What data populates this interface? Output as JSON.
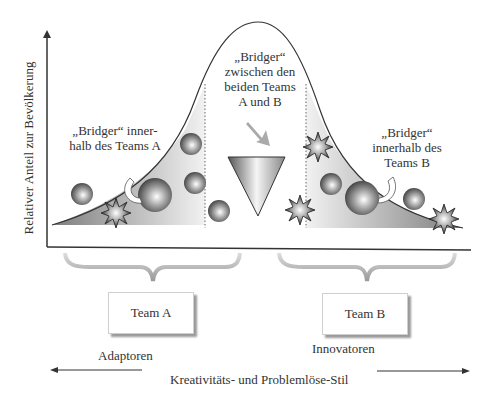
{
  "diagram": {
    "y_axis_label": "Relativer Anteil zur Bevölkerung",
    "x_axis_label": "Kreativitäts- und Problemlöse-Stil",
    "annotations": {
      "bridger_a": [
        "„Bridger“ inner-",
        "halb des Teams A"
      ],
      "bridger_center": [
        "„Bridger“",
        "zwischen den",
        "beiden Teams",
        "A und  B"
      ],
      "bridger_b": [
        "„Bridger“",
        "innerhalb des",
        "Teams B"
      ]
    },
    "teams": {
      "a": {
        "label": "Team  A",
        "style": "Adaptoren"
      },
      "b": {
        "label": "Team  B",
        "style": "Innovatoren"
      }
    },
    "icons": [
      "sphere-icon",
      "starburst-icon",
      "curved-arrow-icon",
      "funnel-icon",
      "bracket-icon"
    ],
    "colors": {
      "line": "#333333",
      "fill_dark": "#8a8a8a",
      "fill_light": "#ececec",
      "box_shadow": "#9a9a9a"
    }
  }
}
